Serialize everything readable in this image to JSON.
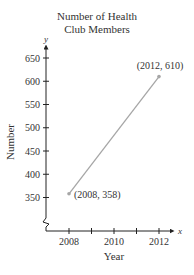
{
  "chart_data": {
    "type": "line",
    "title_lines": [
      "Number of Health",
      "Club Members"
    ],
    "xlabel": "Year",
    "ylabel": "Number",
    "x_axis_var": "x",
    "y_axis_var": "y",
    "x_ticks": [
      2008,
      2009,
      2010,
      2011,
      2012
    ],
    "x_tick_labels": [
      "2008",
      "2010",
      "2012"
    ],
    "y_ticks": [
      350,
      400,
      450,
      500,
      550,
      600,
      650
    ],
    "y_tick_labels": [
      "350",
      "400",
      "450",
      "500",
      "550",
      "600",
      "650"
    ],
    "xlim": [
      2007,
      2012.6
    ],
    "ylim": [
      350,
      650
    ],
    "axis_break": "y",
    "grid": false,
    "series": [
      {
        "name": "Members",
        "x": [
          2008,
          2012
        ],
        "y": [
          358,
          610
        ],
        "color": "#a6a6a6"
      }
    ],
    "annotations": [
      {
        "text": "(2008, 358)",
        "x": 2008,
        "y": 358
      },
      {
        "text": "(2012, 610)",
        "x": 2012,
        "y": 610
      }
    ]
  }
}
